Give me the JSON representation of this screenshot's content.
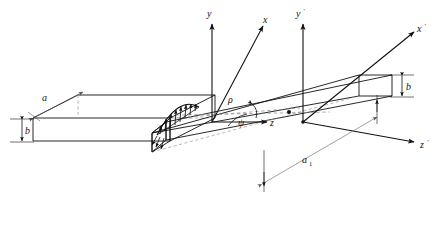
{
  "figure": {
    "background_color": "#ffffff",
    "line_color": "#111111",
    "dashed_color": "#8a8a8a",
    "caption": ""
  },
  "axes": [
    {
      "id": "y",
      "label": "y",
      "prime": "",
      "direction": "up",
      "origin": [
        212,
        122
      ]
    },
    {
      "id": "x",
      "label": "x",
      "prime": "",
      "direction": "upper-right",
      "origin": [
        212,
        122
      ]
    },
    {
      "id": "z",
      "label": "z",
      "prime": "",
      "direction": "right",
      "origin": [
        212,
        122
      ]
    },
    {
      "id": "yprime",
      "label": "y",
      "prime": "'",
      "direction": "up",
      "origin": [
        303,
        122
      ]
    },
    {
      "id": "xprime",
      "label": "x",
      "prime": "'",
      "direction": "upper-right",
      "origin": [
        303,
        122
      ]
    },
    {
      "id": "zprime",
      "label": "z",
      "prime": "'",
      "direction": "right",
      "origin": [
        303,
        122
      ]
    }
  ],
  "dimensions": [
    {
      "id": "a",
      "label": "a",
      "sub": "",
      "desc": "left plate span"
    },
    {
      "id": "b_left",
      "label": "b",
      "sub": "",
      "desc": "left plate thickness"
    },
    {
      "id": "b_right",
      "label": "b",
      "sub": "",
      "desc": "right plate thickness"
    },
    {
      "id": "a1",
      "label": "a",
      "sub": "1",
      "desc": "right plate span"
    }
  ],
  "angles": [
    {
      "id": "rho",
      "label": "ρ",
      "desc": "radius / distance marker along dashed center line"
    },
    {
      "id": "psi",
      "label": "ψ",
      "desc": "angle between z axis and inclined edge"
    }
  ],
  "load": {
    "name": "distributed-load",
    "profile": "half-ellipse",
    "arrow_count": 9,
    "desc": "distributed load arrows along the folded junction edge"
  }
}
